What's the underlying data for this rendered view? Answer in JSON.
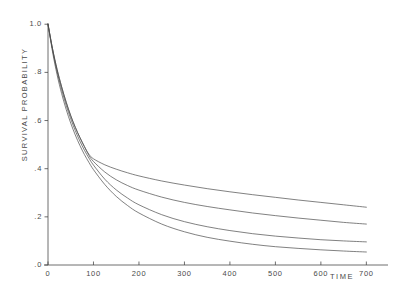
{
  "chart_data": {
    "type": "line",
    "title": "",
    "xlabel": "TIME",
    "ylabel": "SURVIVAL PROBABILITY",
    "xlim": [
      0,
      730
    ],
    "ylim": [
      0.0,
      1.03
    ],
    "grid": false,
    "legend": "none",
    "xticks": [
      0,
      100,
      200,
      300,
      400,
      500,
      600,
      700
    ],
    "xtick_labels": [
      "0",
      "100",
      "200",
      "300",
      "400",
      "500",
      "600",
      "700"
    ],
    "yticks": [
      0.0,
      0.2,
      0.4,
      0.6,
      0.8,
      1.0
    ],
    "ytick_labels": [
      ".0",
      ".2",
      ".4",
      ".6",
      ".8",
      "1.0"
    ],
    "line_color": "#4a4a4a",
    "line_width": 0.7,
    "x": [
      0,
      10,
      20,
      30,
      40,
      50,
      60,
      70,
      80,
      90,
      100,
      125,
      150,
      175,
      200,
      250,
      300,
      350,
      400,
      450,
      500,
      550,
      600,
      650,
      700
    ],
    "series": [
      {
        "name": "curve-1",
        "values": [
          1.0,
          0.898,
          0.812,
          0.74,
          0.676,
          0.62,
          0.572,
          0.53,
          0.492,
          0.46,
          0.441,
          0.416,
          0.398,
          0.383,
          0.37,
          0.349,
          0.332,
          0.317,
          0.304,
          0.292,
          0.281,
          0.27,
          0.26,
          0.25,
          0.24
        ]
      },
      {
        "name": "curve-2",
        "values": [
          1.0,
          0.898,
          0.812,
          0.74,
          0.676,
          0.62,
          0.572,
          0.53,
          0.492,
          0.455,
          0.43,
          0.386,
          0.354,
          0.33,
          0.311,
          0.282,
          0.26,
          0.243,
          0.229,
          0.216,
          0.205,
          0.195,
          0.186,
          0.177,
          0.17
        ]
      },
      {
        "name": "curve-3",
        "values": [
          1.0,
          0.893,
          0.803,
          0.728,
          0.663,
          0.607,
          0.558,
          0.515,
          0.477,
          0.444,
          0.415,
          0.356,
          0.312,
          0.278,
          0.25,
          0.209,
          0.18,
          0.159,
          0.143,
          0.13,
          0.12,
          0.112,
          0.105,
          0.1,
          0.096
        ]
      },
      {
        "name": "curve-4",
        "values": [
          1.0,
          0.885,
          0.79,
          0.712,
          0.646,
          0.589,
          0.54,
          0.497,
          0.459,
          0.426,
          0.396,
          0.334,
          0.285,
          0.247,
          0.216,
          0.17,
          0.138,
          0.115,
          0.099,
          0.086,
          0.076,
          0.069,
          0.063,
          0.058,
          0.054
        ]
      }
    ]
  }
}
